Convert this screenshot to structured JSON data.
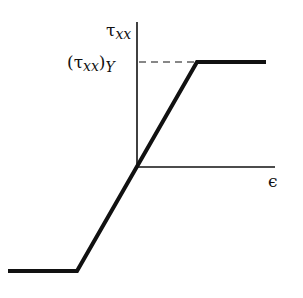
{
  "diagram": {
    "type": "stress-strain elastic-perfectly-plastic",
    "y_axis_label": {
      "main": "τ",
      "sub": "xx"
    },
    "yield_label": {
      "open": "(τ",
      "sub": "xx",
      "close": ")",
      "sub2": "Y"
    },
    "x_axis_label": "ϵ",
    "colors": {
      "line": "#111111",
      "axis": "#111111",
      "background": "#ffffff"
    },
    "geometry": {
      "origin": [
        137,
        167
      ],
      "y_axis_top": 22,
      "x_axis_right": 275,
      "yield_level_y": 62,
      "curve_points": [
        [
          8,
          271
        ],
        [
          77,
          271
        ],
        [
          197,
          62
        ],
        [
          266,
          62
        ]
      ]
    }
  }
}
